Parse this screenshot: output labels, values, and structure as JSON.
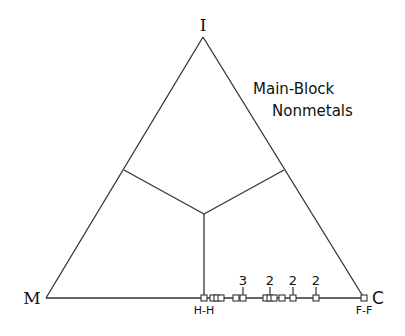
{
  "diagram": {
    "title_lines": [
      "Main-Block",
      "Nonmetals"
    ],
    "vertices": {
      "top": {
        "label": "I",
        "x": 203,
        "y": 37
      },
      "left": {
        "label": "M",
        "x": 46,
        "y": 298
      },
      "right": {
        "label": "C",
        "x": 364,
        "y": 298
      }
    },
    "region_boundaries": {
      "center": {
        "x": 204,
        "y": 214
      },
      "left_edge_point": {
        "x": 124,
        "y": 170
      },
      "right_edge_point": {
        "x": 284,
        "y": 170
      },
      "base_point": {
        "x": 204,
        "y": 298
      }
    },
    "points": [
      {
        "x": 204,
        "label": "H-H",
        "label_pos": "below"
      },
      {
        "x": 213
      },
      {
        "x": 217
      },
      {
        "x": 221
      },
      {
        "x": 236
      },
      {
        "x": 243,
        "count": "3"
      },
      {
        "x": 266
      },
      {
        "x": 270,
        "count": "2"
      },
      {
        "x": 274
      },
      {
        "x": 282
      },
      {
        "x": 293,
        "count": "2"
      },
      {
        "x": 316,
        "count": "2"
      },
      {
        "x": 364,
        "label": "F-F",
        "label_pos": "below"
      }
    ],
    "colors": {
      "line": "#333333",
      "text": "#111111",
      "marker_fill": "#ffffff"
    }
  }
}
